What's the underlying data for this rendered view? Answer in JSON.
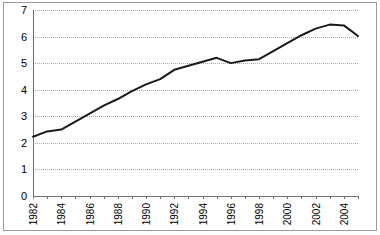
{
  "chart_data": {
    "type": "line",
    "title": "",
    "subtitle": "",
    "xlabel": "",
    "ylabel": "",
    "grid": "horizontal-dotted",
    "legend": "none",
    "ylim": [
      0,
      7
    ],
    "yticks": [
      "0",
      "1",
      "2",
      "3",
      "4",
      "5",
      "6",
      "7"
    ],
    "ytick_values": [
      0,
      1,
      2,
      3,
      4,
      5,
      6,
      7
    ],
    "xlim": [
      1982,
      2005
    ],
    "xticks": [
      "1982",
      "1984",
      "1986",
      "1988",
      "1990",
      "1992",
      "1994",
      "1996",
      "1998",
      "2000",
      "2002",
      "2004"
    ],
    "xtick_values": [
      1982,
      1984,
      1986,
      1988,
      1990,
      1992,
      1994,
      1996,
      1998,
      2000,
      2002,
      2004
    ],
    "xtick_rotation": -90,
    "line_color": "#1a1a1a",
    "gridline_color": "#a9a9a9",
    "axis_color": "#6f6f6f",
    "frame_color": "#9a9a9a",
    "background_color": "#ffffff",
    "x": [
      1982,
      1983,
      1984,
      1985,
      1986,
      1987,
      1988,
      1989,
      1990,
      1991,
      1992,
      1993,
      1994,
      1995,
      1996,
      1997,
      1998,
      1999,
      2000,
      2001,
      2002,
      2003,
      2004,
      2005
    ],
    "series": [
      {
        "name": "value",
        "values": [
          2.23,
          2.43,
          2.5,
          2.8,
          3.1,
          3.4,
          3.65,
          3.95,
          4.2,
          4.4,
          4.75,
          4.9,
          5.05,
          5.2,
          5.0,
          5.1,
          5.15,
          5.45,
          5.75,
          6.05,
          6.3,
          6.45,
          6.42,
          6.02
        ]
      }
    ]
  }
}
